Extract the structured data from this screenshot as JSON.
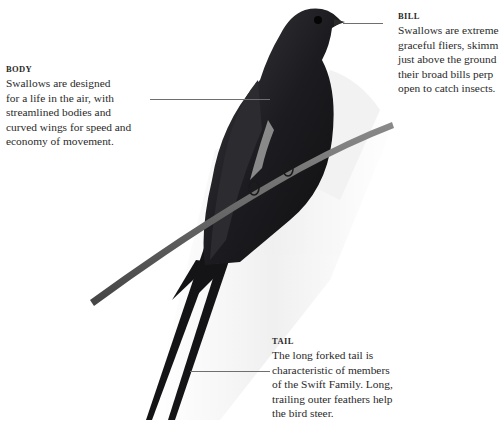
{
  "figure": {
    "colors": {
      "bird": "#1e1e22",
      "branch": "#5a5a5a",
      "sketch": "#cfcfcf",
      "text": "#2a2a2a",
      "leader": "#6f6f6f"
    }
  },
  "callouts": {
    "body": {
      "heading": "BODY",
      "text": "Swallows are designed\nfor a life in the air, with\nstreamlined bodies and\ncurved wings for speed and\neconomy of movement."
    },
    "bill": {
      "heading": "BILL",
      "text": "Swallows are extreme\ngraceful fliers, skimm\njust above the ground\ntheir broad bills perp\nopen to catch insects."
    },
    "tail": {
      "heading": "TAIL",
      "text": "The long forked tail is\ncharacteristic of members\nof the Swift Family. Long,\ntrailing outer feathers help\nthe bird steer."
    }
  }
}
